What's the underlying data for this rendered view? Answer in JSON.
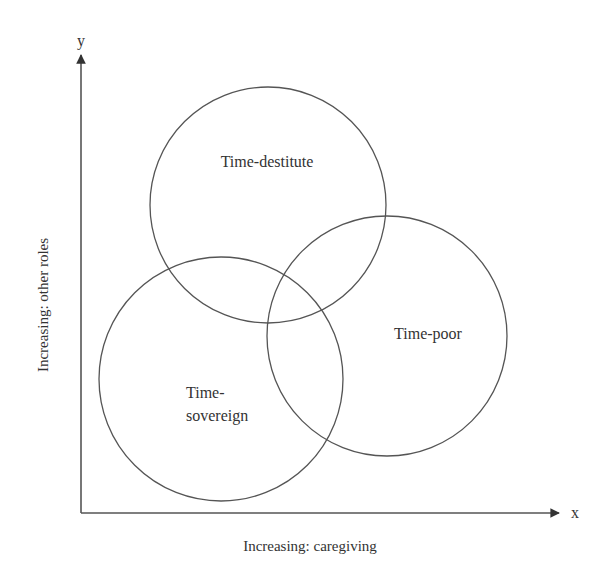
{
  "diagram": {
    "axes": {
      "y_symbol": "y",
      "x_symbol": "x",
      "y_label": "Increasing: other roles",
      "x_label": "Increasing: caregiving"
    },
    "circles": [
      {
        "label": "Time-destitute",
        "cx": 268,
        "cy": 205,
        "r": 118
      },
      {
        "label": "Time-poor",
        "cx": 387,
        "cy": 336,
        "r": 120
      },
      {
        "label_line1": "Time-",
        "label_line2": "sovereign",
        "cx": 221,
        "cy": 379,
        "r": 122
      }
    ],
    "colors": {
      "stroke": "#555555",
      "text": "#333333",
      "background": "#ffffff"
    }
  }
}
